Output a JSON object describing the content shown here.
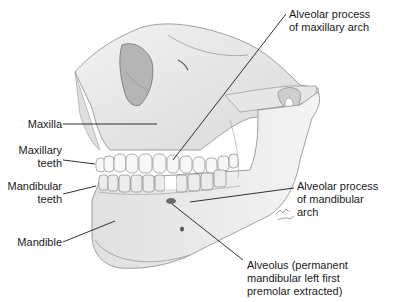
{
  "figure": {
    "colors": {
      "background": "#ffffff",
      "bone": "#ececec",
      "bone_shadow": "#b8b8b8",
      "outline": "#6a6a6a",
      "teeth": "#f6f6f6",
      "leader_line": "#1a1a1a",
      "text": "#1a1a1a"
    }
  },
  "labels": {
    "alveolar_maxillary": "Alveolar process\nof maxillary arch",
    "maxilla": "Maxilla",
    "maxillary_teeth": "Maxillary\nteeth",
    "mandibular_teeth": "Mandibular\nteeth",
    "mandible": "Mandible",
    "alveolar_mandibular": "Alveolar process\nof mandibular\narch",
    "alveolus": "Alveolus (permanent\nmandibular left first\npremolar extracted)"
  },
  "signature": "artist-signature"
}
